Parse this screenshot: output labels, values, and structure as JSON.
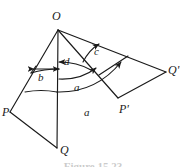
{
  "figure": {
    "caption": "Figure 15.23",
    "ink_color": "#1a1a1a",
    "background_color": "#ffffff",
    "vertices": [
      {
        "name": "O",
        "label": "O",
        "x": 58,
        "y": 30,
        "label_x": 52,
        "label_y": 10
      },
      {
        "name": "P",
        "label": "P",
        "x": 10,
        "y": 112,
        "label_x": 2,
        "label_y": 106
      },
      {
        "name": "Q",
        "label": "Q",
        "x": 57,
        "y": 148,
        "label_x": 60,
        "label_y": 144
      },
      {
        "name": "P-prime",
        "label": "P'",
        "x": 118,
        "y": 98,
        "label_x": 119,
        "label_y": 103
      },
      {
        "name": "Q-prime",
        "label": "Q'",
        "x": 166,
        "y": 72,
        "label_x": 168,
        "label_y": 64
      }
    ],
    "segment_labels": [
      {
        "name": "b",
        "label": "b",
        "x": 38,
        "y": 72
      },
      {
        "name": "d",
        "label": "d",
        "x": 64,
        "y": 62
      },
      {
        "name": "c",
        "label": "c",
        "x": 94,
        "y": 52
      },
      {
        "name": "a-inner",
        "label": "a",
        "x": 74,
        "y": 82
      },
      {
        "name": "a-outer",
        "label": "a",
        "x": 84,
        "y": 107
      }
    ],
    "arc_count": 4,
    "ray_count": 4
  }
}
